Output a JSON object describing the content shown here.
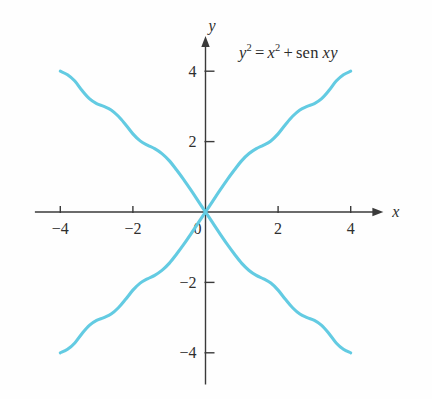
{
  "figure": {
    "name": "implicit-curve-plot",
    "background_color": "#ffffff",
    "curve_color": "#63cbe2",
    "axis_color": "#3a3a3a",
    "equation_label": {
      "full_text": "y² = x² + sen xy",
      "lhs_base": "y",
      "lhs_exp": "2",
      "equals": "=",
      "rhs_base": "x",
      "rhs_exp": "2",
      "plus": "+",
      "function_name": "sen",
      "function_args": "xy"
    },
    "axes": {
      "x_label": "x",
      "y_label": "y",
      "origin_label": "0",
      "x_ticks": [
        {
          "value": -4,
          "label": "−4"
        },
        {
          "value": -2,
          "label": "−2"
        },
        {
          "value": 2,
          "label": "2"
        },
        {
          "value": 4,
          "label": "4"
        }
      ],
      "y_ticks": [
        {
          "value": 4,
          "label": "4"
        },
        {
          "value": 2,
          "label": "2"
        },
        {
          "value": -2,
          "label": "−2"
        },
        {
          "value": -4,
          "label": "−4"
        }
      ],
      "x_range": [
        -4.7,
        4.9
      ],
      "y_range": [
        -4.9,
        5.0
      ]
    }
  },
  "chart_data": {
    "type": "line",
    "title": "",
    "subtitle": "",
    "xlabel": "x",
    "ylabel": "y",
    "xlim": [
      -4.7,
      4.9
    ],
    "ylim": [
      -4.9,
      5.0
    ],
    "grid": false,
    "legend": null,
    "annotations": [
      {
        "text": "y² = x² + sen xy",
        "x": 1.1,
        "y": 4.6
      }
    ],
    "xticks": [
      -4,
      -2,
      0,
      2,
      4
    ],
    "yticks": [
      -4,
      -2,
      0,
      2,
      4
    ],
    "series": [
      {
        "name": "branch-rising",
        "comment": "Quadrant III through origin into Quadrant I; wavy, passes near (4,4) and (-4,-4)",
        "points": [
          [
            -4.0,
            -4.0
          ],
          [
            -3.8,
            -3.9
          ],
          [
            -3.6,
            -3.72
          ],
          [
            -3.4,
            -3.45
          ],
          [
            -3.2,
            -3.22
          ],
          [
            -3.0,
            -3.08
          ],
          [
            -2.8,
            -3.0
          ],
          [
            -2.6,
            -2.9
          ],
          [
            -2.4,
            -2.72
          ],
          [
            -2.2,
            -2.48
          ],
          [
            -2.0,
            -2.22
          ],
          [
            -1.8,
            -2.02
          ],
          [
            -1.6,
            -1.9
          ],
          [
            -1.4,
            -1.8
          ],
          [
            -1.2,
            -1.66
          ],
          [
            -1.0,
            -1.46
          ],
          [
            -0.8,
            -1.2
          ],
          [
            -0.6,
            -0.92
          ],
          [
            -0.4,
            -0.62
          ],
          [
            -0.2,
            -0.31
          ],
          [
            0.0,
            0.0
          ],
          [
            0.2,
            0.31
          ],
          [
            0.4,
            0.62
          ],
          [
            0.6,
            0.92
          ],
          [
            0.8,
            1.2
          ],
          [
            1.0,
            1.46
          ],
          [
            1.2,
            1.66
          ],
          [
            1.4,
            1.8
          ],
          [
            1.6,
            1.9
          ],
          [
            1.8,
            2.02
          ],
          [
            2.0,
            2.22
          ],
          [
            2.2,
            2.48
          ],
          [
            2.4,
            2.72
          ],
          [
            2.6,
            2.9
          ],
          [
            2.8,
            3.0
          ],
          [
            3.0,
            3.08
          ],
          [
            3.2,
            3.22
          ],
          [
            3.4,
            3.45
          ],
          [
            3.6,
            3.72
          ],
          [
            3.8,
            3.9
          ],
          [
            4.0,
            4.0
          ]
        ]
      },
      {
        "name": "branch-falling",
        "comment": "Quadrant II through origin into Quadrant IV; mirror image of rising branch about the y-axis",
        "points": [
          [
            -4.0,
            4.0
          ],
          [
            -3.8,
            3.9
          ],
          [
            -3.6,
            3.72
          ],
          [
            -3.4,
            3.45
          ],
          [
            -3.2,
            3.22
          ],
          [
            -3.0,
            3.08
          ],
          [
            -2.8,
            3.0
          ],
          [
            -2.6,
            2.9
          ],
          [
            -2.4,
            2.72
          ],
          [
            -2.2,
            2.48
          ],
          [
            -2.0,
            2.22
          ],
          [
            -1.8,
            2.02
          ],
          [
            -1.6,
            1.9
          ],
          [
            -1.4,
            1.8
          ],
          [
            -1.2,
            1.66
          ],
          [
            -1.0,
            1.46
          ],
          [
            -0.8,
            1.2
          ],
          [
            -0.6,
            0.92
          ],
          [
            -0.4,
            0.62
          ],
          [
            -0.2,
            0.31
          ],
          [
            0.0,
            0.0
          ],
          [
            0.2,
            -0.31
          ],
          [
            0.4,
            -0.62
          ],
          [
            0.6,
            -0.92
          ],
          [
            0.8,
            -1.2
          ],
          [
            1.0,
            -1.46
          ],
          [
            1.2,
            -1.66
          ],
          [
            1.4,
            -1.8
          ],
          [
            1.6,
            -1.9
          ],
          [
            1.8,
            -2.02
          ],
          [
            2.0,
            -2.22
          ],
          [
            2.2,
            -2.48
          ],
          [
            2.4,
            -2.72
          ],
          [
            2.6,
            -2.9
          ],
          [
            2.8,
            -3.0
          ],
          [
            3.0,
            -3.08
          ],
          [
            3.2,
            -3.22
          ],
          [
            3.4,
            -3.45
          ],
          [
            3.6,
            -3.72
          ],
          [
            3.8,
            -3.9
          ],
          [
            4.0,
            -4.0
          ]
        ]
      }
    ]
  }
}
